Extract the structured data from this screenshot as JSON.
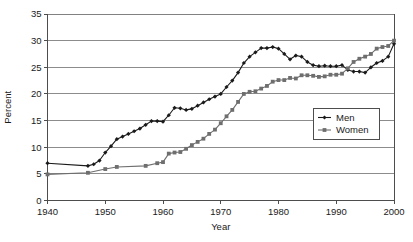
{
  "chart_data": {
    "type": "line",
    "title": "",
    "xlabel": "Year",
    "ylabel": "Percent",
    "xlim": [
      1940,
      2000
    ],
    "ylim": [
      0,
      35
    ],
    "xticks": [
      1940,
      1950,
      1960,
      1970,
      1980,
      1990,
      2000
    ],
    "yticks": [
      0,
      5,
      10,
      15,
      20,
      25,
      30,
      35
    ],
    "grid": "horizontal",
    "legend_position": "inside-right-lower",
    "series": [
      {
        "name": "Men",
        "marker": "diamond",
        "color": "#1a1a1a",
        "x": [
          1940,
          1947,
          1948,
          1949,
          1950,
          1951,
          1952,
          1953,
          1954,
          1955,
          1956,
          1957,
          1958,
          1959,
          1960,
          1961,
          1962,
          1963,
          1964,
          1965,
          1966,
          1967,
          1968,
          1969,
          1970,
          1971,
          1972,
          1973,
          1974,
          1975,
          1976,
          1977,
          1978,
          1979,
          1980,
          1981,
          1982,
          1983,
          1984,
          1985,
          1986,
          1987,
          1988,
          1989,
          1990,
          1991,
          1992,
          1993,
          1994,
          1995,
          1996,
          1997,
          1998,
          1999,
          2000
        ],
        "y": [
          7.0,
          6.5,
          6.8,
          7.5,
          9.0,
          10.2,
          11.5,
          12.0,
          12.5,
          13.0,
          13.5,
          14.2,
          14.9,
          14.9,
          14.8,
          16.0,
          17.4,
          17.3,
          17.0,
          17.2,
          17.8,
          18.4,
          19.0,
          19.5,
          20.0,
          21.3,
          22.5,
          24.0,
          25.8,
          27.0,
          27.8,
          28.6,
          28.6,
          28.8,
          28.5,
          27.5,
          26.5,
          27.2,
          27.0,
          26.0,
          25.4,
          25.2,
          25.3,
          25.2,
          25.2,
          25.4,
          24.5,
          24.2,
          24.2,
          24.0,
          25.0,
          25.8,
          26.2,
          27.0,
          29.4
        ]
      },
      {
        "name": "Women",
        "marker": "square",
        "color": "#6e6e6e",
        "x": [
          1940,
          1947,
          1950,
          1952,
          1957,
          1959,
          1960,
          1961,
          1962,
          1963,
          1964,
          1965,
          1966,
          1967,
          1968,
          1969,
          1970,
          1971,
          1972,
          1973,
          1974,
          1975,
          1976,
          1977,
          1978,
          1979,
          1980,
          1981,
          1982,
          1983,
          1984,
          1985,
          1986,
          1987,
          1988,
          1989,
          1990,
          1991,
          1992,
          1993,
          1994,
          1995,
          1996,
          1997,
          1998,
          1999,
          2000
        ],
        "y": [
          4.9,
          5.2,
          5.9,
          6.3,
          6.5,
          7.0,
          7.2,
          8.8,
          9.0,
          9.1,
          9.7,
          10.4,
          11.0,
          11.6,
          12.5,
          13.3,
          14.5,
          15.8,
          17.0,
          18.5,
          20.0,
          20.4,
          20.5,
          21.0,
          21.5,
          22.3,
          22.6,
          22.6,
          23.0,
          22.9,
          23.5,
          23.5,
          23.4,
          23.2,
          23.3,
          23.6,
          23.6,
          23.8,
          24.8,
          26.0,
          26.6,
          27.0,
          27.5,
          28.5,
          28.8,
          29.0,
          30.0
        ]
      }
    ]
  },
  "axes": {
    "y_title": "Percent",
    "x_title": "Year",
    "y_tick_labels": [
      "0",
      "5",
      "10",
      "15",
      "20",
      "25",
      "30",
      "35"
    ],
    "x_tick_labels": [
      "1940",
      "1950",
      "1960",
      "1970",
      "1980",
      "1990",
      "2000"
    ]
  },
  "legend": {
    "entries": [
      {
        "label": "Men"
      },
      {
        "label": "Women"
      }
    ]
  },
  "colors": {
    "men": "#1a1a1a",
    "women": "#6e6e6e",
    "grid": "#808080",
    "axis": "#4d4d4d",
    "background": "#ffffff"
  }
}
